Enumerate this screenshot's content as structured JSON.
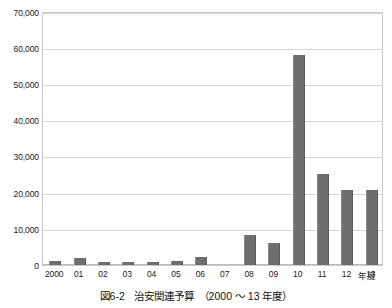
{
  "caption": {
    "number": "図6-2",
    "title": "治安関連予算",
    "range": "（2000 〜 13 年度）"
  },
  "axes": {
    "x_axis_title": "年度",
    "y_tick_labels": [
      "70,000",
      "60,000",
      "50,000",
      "40,000",
      "30,000",
      "20,000",
      "10,000",
      "0"
    ]
  },
  "chart_data": {
    "type": "bar",
    "xlabel": "年度",
    "ylabel": "",
    "ylim": [
      0,
      70000
    ],
    "ytick_values": [
      0,
      10000,
      20000,
      30000,
      40000,
      50000,
      60000,
      70000
    ],
    "grid": true,
    "legend": false,
    "bar_color": "#6e6e6e",
    "categories": [
      "2000",
      "01",
      "02",
      "03",
      "04",
      "05",
      "06",
      "07",
      "08",
      "09",
      "10",
      "11",
      "12",
      "13"
    ],
    "values": [
      1200,
      1900,
      900,
      700,
      900,
      1200,
      2200,
      0,
      8300,
      6200,
      57800,
      25000,
      20700,
      20700
    ]
  }
}
